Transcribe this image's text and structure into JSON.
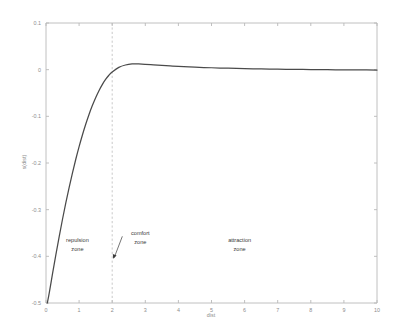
{
  "chart_data": {
    "type": "line",
    "title": "",
    "xlabel": "dist",
    "ylabel": "s(dist)",
    "xlim": [
      0,
      10
    ],
    "ylim": [
      -0.5,
      0.1
    ],
    "grid": false,
    "legend": null,
    "xticks": [
      "0",
      "1",
      "2",
      "3",
      "4",
      "5",
      "6",
      "7",
      "8",
      "9",
      "10"
    ],
    "xtick_values": [
      0,
      1,
      2,
      3,
      4,
      5,
      6,
      7,
      8,
      9,
      10
    ],
    "yticks": [
      "0.1",
      "0",
      "-0.1",
      "-0.2",
      "-0.3",
      "-0.4",
      "-0.5"
    ],
    "ytick_values": [
      0.1,
      0,
      -0.1,
      -0.2,
      -0.3,
      -0.4,
      -0.5
    ],
    "series": [
      {
        "name": "s(dist)",
        "color": "#4a4a4a",
        "x": [
          0.04,
          0.1,
          0.2,
          0.3,
          0.4,
          0.5,
          0.6,
          0.7,
          0.8,
          0.9,
          1.0,
          1.1,
          1.2,
          1.3,
          1.4,
          1.5,
          1.6,
          1.7,
          1.8,
          1.9,
          2.0,
          2.2,
          2.4,
          2.6,
          2.8,
          3.0,
          3.25,
          3.5,
          3.75,
          4.0,
          4.5,
          5.0,
          5.5,
          6.0,
          6.5,
          7.0,
          7.5,
          8.0,
          8.5,
          9.0,
          9.5,
          10.0
        ],
        "y": [
          -0.5,
          -0.478,
          -0.436,
          -0.396,
          -0.357,
          -0.32,
          -0.285,
          -0.252,
          -0.221,
          -0.192,
          -0.165,
          -0.14,
          -0.117,
          -0.096,
          -0.077,
          -0.06,
          -0.045,
          -0.032,
          -0.021,
          -0.012,
          -0.005,
          0.005,
          0.01,
          0.0122,
          0.0122,
          0.0115,
          0.0103,
          0.009,
          0.0079,
          0.0069,
          0.0053,
          0.0041,
          0.0031,
          0.0023,
          0.0016,
          0.0011,
          0.0006,
          0.0002,
          -0.0001,
          -0.0004,
          -0.0006,
          -0.0008
        ]
      }
    ],
    "vertical_markers": [
      {
        "name": "comfort-distance",
        "x": 2,
        "style": "dashed",
        "color": "#bdbdbd"
      }
    ],
    "annotations": [
      {
        "name": "repulsion-zone",
        "line1": "repulsion",
        "line2": "zone",
        "x": 0.95,
        "y": -0.37
      },
      {
        "name": "comfort-zone",
        "line1": "comfort",
        "line2": "zone",
        "x": 2.85,
        "y": -0.355,
        "arrow_to_x": 2.0,
        "arrow_to_y": -0.405
      },
      {
        "name": "attraction-zone",
        "line1": "attraction",
        "line2": "zone",
        "x": 5.85,
        "y": -0.37
      }
    ]
  }
}
